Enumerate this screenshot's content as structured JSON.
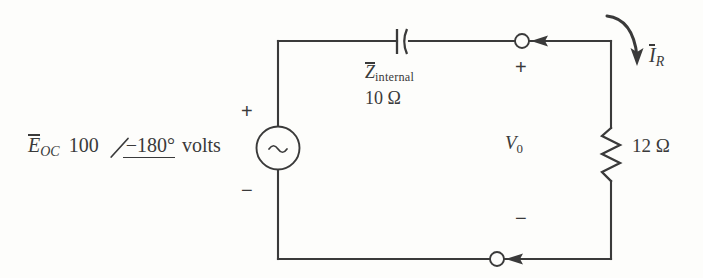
{
  "figure": {
    "line_color": "#3a3a3a",
    "background_color": "#fdfdfb"
  },
  "source": {
    "symbol_name": "ac-source-sine",
    "symbol_glyph": "∼",
    "name_label": "E",
    "name_subscript": "OC",
    "magnitude": "100",
    "angle_symbol": "∠",
    "phase": "−180°",
    "units": "volts",
    "plus_sign": "+",
    "minus_sign": "−"
  },
  "impedance": {
    "symbol_name": "capacitor",
    "name_label": "Z",
    "name_subscript": "internal",
    "value": "10 Ω"
  },
  "load": {
    "symbol_name": "resistor-zigzag",
    "value": "12 Ω"
  },
  "current": {
    "name_label": "I",
    "name_subscript": "R",
    "direction": "clockwise-down"
  },
  "output": {
    "name_label": "V",
    "name_subscript": "0",
    "plus_sign": "+",
    "minus_sign": "−",
    "terminal_top": "open-circle",
    "terminal_bottom": "open-circle"
  }
}
